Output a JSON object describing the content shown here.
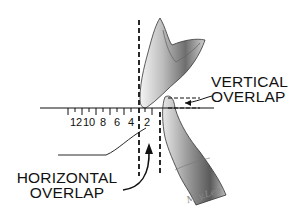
{
  "diagram": {
    "labels": {
      "vertical_overlap": [
        "VERTICAL",
        "OVERLAP"
      ],
      "horizontal_overlap": [
        "HORIZONTAL",
        "OVERLAP"
      ]
    },
    "ruler": {
      "tick_labels": [
        "12",
        "10",
        "8",
        "6",
        "4",
        "2"
      ]
    },
    "signature": "M.y.Lee",
    "colors": {
      "ink": "#111111",
      "tooth_shade": "#8a8a8a",
      "background": "#ffffff"
    }
  }
}
